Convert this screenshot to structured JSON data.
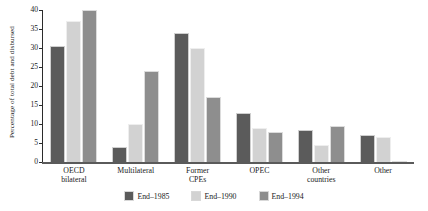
{
  "chart_data": {
    "type": "bar",
    "title": "",
    "xlabel": "",
    "ylabel": "Percentage of total debt and disbursed",
    "categories": [
      "OECD bilateral",
      "Multilateral",
      "Former CPEs",
      "OPEC",
      "Other countries",
      "Other"
    ],
    "category_lines": [
      [
        "OECD",
        "bilateral"
      ],
      [
        "Multilateral"
      ],
      [
        "Former",
        "CPEs"
      ],
      [
        "OPEC"
      ],
      [
        "Other",
        "countries"
      ],
      [
        "Other"
      ]
    ],
    "series": [
      {
        "name": "End–1985",
        "color": "#5b5b5b",
        "values": [
          30.5,
          4.0,
          34.0,
          13.0,
          8.5,
          7.0
        ]
      },
      {
        "name": "End–1990",
        "color": "#d2d2d2",
        "values": [
          37.0,
          10.0,
          30.0,
          9.0,
          4.5,
          6.5
        ]
      },
      {
        "name": "End–1994",
        "color": "#8e8e8e",
        "values": [
          40.0,
          24.0,
          17.0,
          8.0,
          9.5,
          0.3
        ]
      }
    ],
    "ylim": [
      0,
      40
    ],
    "yticks": [
      0,
      5,
      10,
      15,
      20,
      25,
      30,
      35,
      40
    ],
    "ytick_labels": [
      "0",
      "5",
      "10",
      "15",
      "20",
      "25",
      "30",
      "35",
      "40"
    ],
    "grid": false,
    "legend_position": "bottom-center"
  }
}
